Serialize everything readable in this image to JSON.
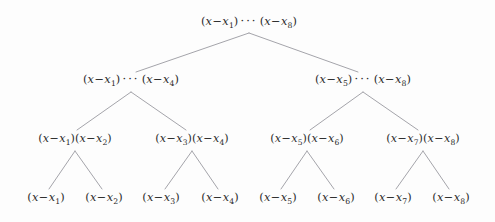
{
  "figure": {
    "name": "product-tree-divide-and-conquer",
    "background_color": "#fdfdfd",
    "edge_color": "#9a9aa0",
    "text_color": "#2b2b2b",
    "width": 495,
    "height": 222
  },
  "chart_data": {
    "type": "diagram",
    "subtype": "binary-tree",
    "title": "",
    "levels": 4,
    "node_count": 15,
    "nodes": [
      {
        "id": "n0",
        "level": 0,
        "label": "(x-x_1) ... (x-x_8)",
        "factors_from": 1,
        "factors_to": 8,
        "has_ellipsis": true,
        "x": 249,
        "y": 23
      },
      {
        "id": "n1",
        "level": 1,
        "label": "(x-x_1) ... (x-x_4)",
        "factors_from": 1,
        "factors_to": 4,
        "has_ellipsis": true,
        "x": 131,
        "y": 81
      },
      {
        "id": "n2",
        "level": 1,
        "label": "(x-x_5) ... (x-x_8)",
        "factors_from": 5,
        "factors_to": 8,
        "has_ellipsis": true,
        "x": 363,
        "y": 81
      },
      {
        "id": "n3",
        "level": 2,
        "label": "(x-x_1)(x-x_2)",
        "factors_from": 1,
        "factors_to": 2,
        "has_ellipsis": false,
        "x": 75,
        "y": 140
      },
      {
        "id": "n4",
        "level": 2,
        "label": "(x-x_3)(x-x_4)",
        "factors_from": 3,
        "factors_to": 4,
        "has_ellipsis": false,
        "x": 192,
        "y": 140
      },
      {
        "id": "n5",
        "level": 2,
        "label": "(x-x_5)(x-x_6)",
        "factors_from": 5,
        "factors_to": 6,
        "has_ellipsis": false,
        "x": 307,
        "y": 140
      },
      {
        "id": "n6",
        "level": 2,
        "label": "(x-x_7)(x-x_8)",
        "factors_from": 7,
        "factors_to": 8,
        "has_ellipsis": false,
        "x": 423,
        "y": 140
      },
      {
        "id": "n7",
        "level": 3,
        "label": "(x-x_1)",
        "factors_from": 1,
        "factors_to": 1,
        "has_ellipsis": false,
        "x": 46,
        "y": 199
      },
      {
        "id": "n8",
        "level": 3,
        "label": "(x-x_2)",
        "factors_from": 2,
        "factors_to": 2,
        "has_ellipsis": false,
        "x": 104,
        "y": 199
      },
      {
        "id": "n9",
        "level": 3,
        "label": "(x-x_3)",
        "factors_from": 3,
        "factors_to": 3,
        "has_ellipsis": false,
        "x": 161,
        "y": 199
      },
      {
        "id": "n10",
        "level": 3,
        "label": "(x-x_4)",
        "factors_from": 4,
        "factors_to": 4,
        "has_ellipsis": false,
        "x": 220,
        "y": 199
      },
      {
        "id": "n11",
        "level": 3,
        "label": "(x-x_5)",
        "factors_from": 5,
        "factors_to": 5,
        "has_ellipsis": false,
        "x": 278,
        "y": 199
      },
      {
        "id": "n12",
        "level": 3,
        "label": "(x-x_6)",
        "factors_from": 6,
        "factors_to": 6,
        "has_ellipsis": false,
        "x": 336,
        "y": 199
      },
      {
        "id": "n13",
        "level": 3,
        "label": "(x-x_7)",
        "factors_from": 7,
        "factors_to": 7,
        "has_ellipsis": false,
        "x": 393,
        "y": 199
      },
      {
        "id": "n14",
        "level": 3,
        "label": "(x-x_8)",
        "factors_from": 8,
        "factors_to": 8,
        "has_ellipsis": false,
        "x": 451,
        "y": 199
      }
    ],
    "edges": [
      {
        "from": "n0",
        "to": "n1",
        "x1": 249,
        "y1": 33,
        "x2": 136,
        "y2": 72
      },
      {
        "from": "n0",
        "to": "n2",
        "x1": 249,
        "y1": 33,
        "x2": 358,
        "y2": 72
      },
      {
        "from": "n1",
        "to": "n3",
        "x1": 131,
        "y1": 92,
        "x2": 77,
        "y2": 130
      },
      {
        "from": "n1",
        "to": "n4",
        "x1": 131,
        "y1": 92,
        "x2": 186,
        "y2": 130
      },
      {
        "from": "n2",
        "to": "n5",
        "x1": 363,
        "y1": 92,
        "x2": 310,
        "y2": 130
      },
      {
        "from": "n2",
        "to": "n6",
        "x1": 363,
        "y1": 92,
        "x2": 418,
        "y2": 130
      },
      {
        "from": "n3",
        "to": "n7",
        "x1": 75,
        "y1": 151,
        "x2": 49,
        "y2": 189
      },
      {
        "from": "n3",
        "to": "n8",
        "x1": 75,
        "y1": 151,
        "x2": 102,
        "y2": 189
      },
      {
        "from": "n4",
        "to": "n9",
        "x1": 192,
        "y1": 151,
        "x2": 165,
        "y2": 189
      },
      {
        "from": "n4",
        "to": "n10",
        "x1": 192,
        "y1": 151,
        "x2": 218,
        "y2": 189
      },
      {
        "from": "n5",
        "to": "n11",
        "x1": 307,
        "y1": 151,
        "x2": 281,
        "y2": 189
      },
      {
        "from": "n5",
        "to": "n12",
        "x1": 307,
        "y1": 151,
        "x2": 334,
        "y2": 189
      },
      {
        "from": "n6",
        "to": "n13",
        "x1": 423,
        "y1": 151,
        "x2": 396,
        "y2": 189
      },
      {
        "from": "n6",
        "to": "n14",
        "x1": 423,
        "y1": 151,
        "x2": 449,
        "y2": 189
      }
    ],
    "symbols": {
      "variable": "x",
      "minus": "−",
      "ellipsis": "···",
      "open_paren": "(",
      "close_paren": ")"
    }
  }
}
